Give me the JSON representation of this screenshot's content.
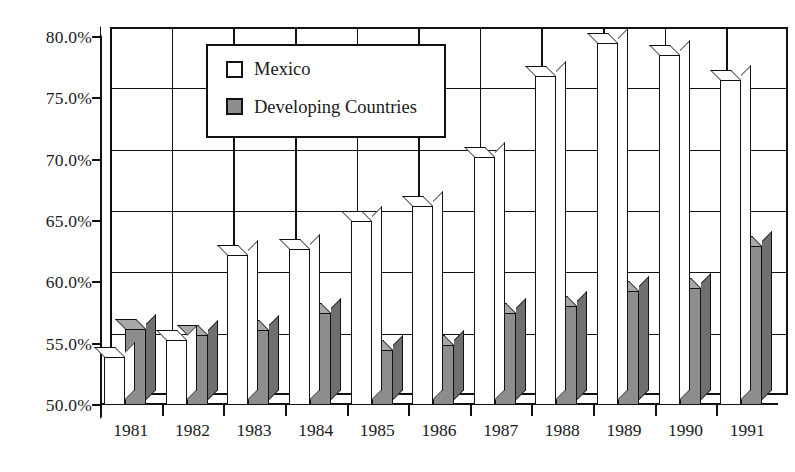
{
  "chart_data": {
    "type": "bar",
    "title": "",
    "subtitle": "",
    "xlabel": "",
    "ylabel": "",
    "categories": [
      "1981",
      "1982",
      "1983",
      "1984",
      "1985",
      "1986",
      "1987",
      "1988",
      "1989",
      "1990",
      "1991"
    ],
    "series": [
      {
        "name": "Mexico",
        "color": "#ffffff",
        "values": [
          53.9,
          55.3,
          62.2,
          62.7,
          65.0,
          66.2,
          70.2,
          76.8,
          79.5,
          78.5,
          76.5
        ]
      },
      {
        "name": "Developing Countries",
        "color": "#8d8d8d",
        "values": [
          56.2,
          55.7,
          56.1,
          57.5,
          54.5,
          54.9,
          57.5,
          58.1,
          59.3,
          59.5,
          63.0
        ]
      }
    ],
    "ylim": [
      50.0,
      80.0
    ],
    "ytick_values": [
      50.0,
      55.0,
      60.0,
      65.0,
      70.0,
      75.0,
      80.0
    ],
    "ytick_labels": [
      "50.0%",
      "55.0%",
      "60.0%",
      "65.0%",
      "70.0%",
      "75.0%",
      "80.0%"
    ],
    "grid": true,
    "legend_position": "upper-left-inside",
    "style": "3d-column"
  },
  "legend": {
    "entries": [
      {
        "label": "Mexico",
        "swatch": "white"
      },
      {
        "label": "Developing Countries",
        "swatch": "gray"
      }
    ]
  }
}
